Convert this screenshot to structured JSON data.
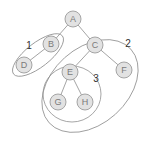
{
  "diagram": {
    "type": "tree",
    "nodes": [
      {
        "id": "A",
        "label": "A",
        "x": 73,
        "y": 19
      },
      {
        "id": "B",
        "label": "B",
        "x": 51,
        "y": 44
      },
      {
        "id": "C",
        "label": "C",
        "x": 95,
        "y": 45
      },
      {
        "id": "D",
        "label": "D",
        "x": 24,
        "y": 65
      },
      {
        "id": "E",
        "label": "E",
        "x": 70,
        "y": 72
      },
      {
        "id": "F",
        "label": "F",
        "x": 124,
        "y": 70
      },
      {
        "id": "G",
        "label": "G",
        "x": 58,
        "y": 102
      },
      {
        "id": "H",
        "label": "H",
        "x": 85,
        "y": 102
      }
    ],
    "edges": [
      [
        "A",
        "B"
      ],
      [
        "A",
        "C"
      ],
      [
        "B",
        "D"
      ],
      [
        "C",
        "E"
      ],
      [
        "C",
        "F"
      ],
      [
        "E",
        "G"
      ],
      [
        "E",
        "H"
      ]
    ],
    "groups": [
      {
        "label": "1",
        "members": [
          "B",
          "D"
        ]
      },
      {
        "label": "2",
        "members": [
          "C",
          "E",
          "F",
          "G",
          "H"
        ]
      },
      {
        "label": "3",
        "members": [
          "E",
          "G",
          "H"
        ]
      }
    ]
  }
}
